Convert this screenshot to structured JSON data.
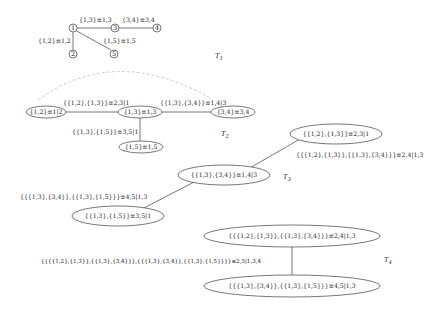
{
  "trees": {
    "t1": {
      "name": "T",
      "subscript": "1",
      "nodes": [
        "1",
        "2",
        "3",
        "4",
        "5"
      ],
      "edges": [
        {
          "from": "1",
          "to": "3",
          "label": "{1,3}≡1,3"
        },
        {
          "from": "3",
          "to": "4",
          "label": "{3,4}≡3,4"
        },
        {
          "from": "1",
          "to": "2",
          "label": "{1,2}≡1,2"
        },
        {
          "from": "1",
          "to": "5",
          "label": "{1,5}≡1,5"
        }
      ]
    },
    "t2": {
      "name": "T",
      "subscript": "2",
      "nodes": [
        "{1,2}≡1|2",
        "{1,3}≡1,3",
        "{3,4}≡3,4",
        "{1,5}≡1,5"
      ],
      "edges": [
        {
          "label": "{{1,2},{1,3}}≡2,3|1"
        },
        {
          "label": "{{1,3},{3,4}}≡1,4|3"
        },
        {
          "label": "{{1,3},{1,5}}≡3,5|1"
        }
      ]
    },
    "t3": {
      "name": "T",
      "subscript": "3",
      "nodes": [
        "{{1,2},{1,3}}≡2,3|1",
        "{{1,3},{3,4}}≡1,4|3",
        "{{1,3},{1,5}}≡3,5|1"
      ],
      "edges": [
        {
          "label": "{{{1,2},{1,3}},{{1,3},{3,4}}}≡2,4|1,3"
        },
        {
          "label": "{{{1,3},{3,4}},{{1,3},{1,5}}}≡4,5|1,3"
        }
      ]
    },
    "t4": {
      "name": "T",
      "subscript": "4",
      "nodes": [
        "{{{1,2},{1,3}},{{1,3},{3,4}}}≡2,4|1,3",
        "{{{1,3},{3,4}},{{1,3},{1,5}}}≡4,5|1,3"
      ],
      "edges": [
        {
          "label": "{{{{1,2},{1,3}},{{1,3},{3,4}}},{{{1,3},{3,4}},{{1,3},{1,5}}}}≡2,5|1,3,4"
        }
      ]
    }
  }
}
